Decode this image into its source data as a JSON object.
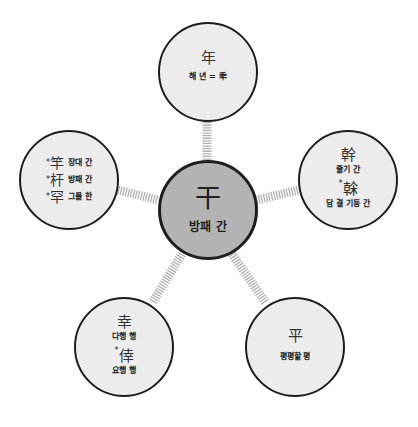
{
  "colors": {
    "center_fill": "#b3b3b3",
    "node_fill": "#ececec",
    "outline": "#1e1e1e",
    "connector": "#bdbdbd"
  },
  "center": {
    "hanja": "干",
    "meaning": "방패 간"
  },
  "nodes": {
    "top": {
      "items": [
        {
          "hanja": "年",
          "meaning": "해 년 = 秊",
          "star": ""
        }
      ]
    },
    "right": {
      "items": [
        {
          "hanja": "幹",
          "meaning": "줄기 간",
          "star": ""
        },
        {
          "hanja": "榦",
          "meaning": "담 결 기둥 간",
          "star": "*"
        }
      ]
    },
    "left": {
      "items": [
        {
          "hanja": "竿",
          "meaning": "장대 간",
          "star": "*"
        },
        {
          "hanja": "杆",
          "meaning": "방패 간",
          "star": "*"
        },
        {
          "hanja": "罕",
          "meaning": "그물 한",
          "star": "*"
        }
      ]
    },
    "bottom_left": {
      "items": [
        {
          "hanja": "幸",
          "meaning": "다행 행",
          "star": ""
        },
        {
          "hanja": "倖",
          "meaning": "요행 행",
          "star": "*"
        }
      ]
    },
    "bottom_right": {
      "items": [
        {
          "hanja": "平",
          "meaning": "평평할 평",
          "star": ""
        }
      ]
    }
  }
}
